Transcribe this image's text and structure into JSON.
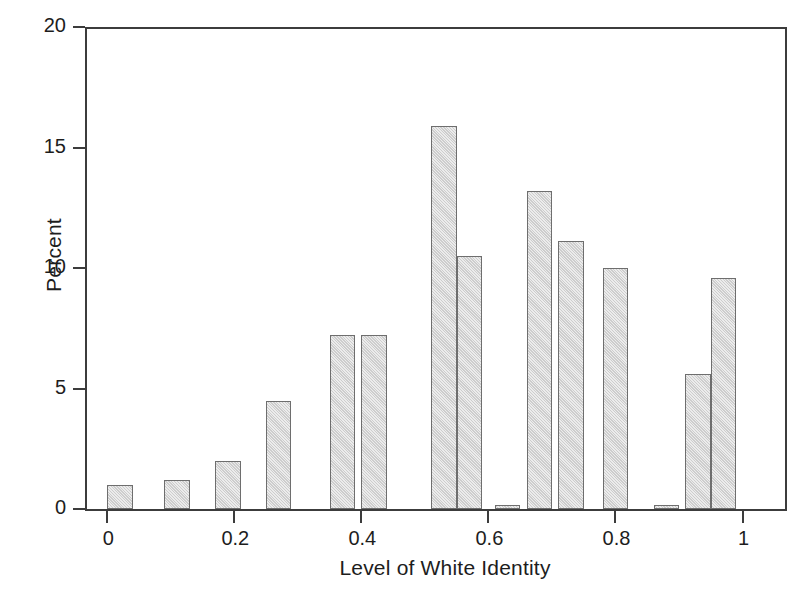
{
  "figure": {
    "background": "#ffffff",
    "bar_fill": "#d4d4d4",
    "bar_stroke": "#6e6e6e",
    "axis_color": "#3c3c3c"
  },
  "axes": {
    "ylabel": "Percent",
    "xlabel": "Level of White Identity",
    "ytick_labels": [
      "0",
      "5",
      "10",
      "15",
      "20"
    ],
    "xtick_labels": [
      "0",
      "0.2",
      "0.4",
      "0.6",
      "0.8",
      "1"
    ]
  },
  "chart_data": {
    "type": "bar",
    "title": "",
    "subtitle": "",
    "xlabel": "Level of White Identity",
    "ylabel": "Percent",
    "xlim": [
      -0.035,
      1.07
    ],
    "ylim": [
      0,
      20
    ],
    "yticks": [
      0,
      5,
      10,
      15,
      20
    ],
    "xticks": [
      0,
      0.2,
      0.4,
      0.6,
      0.8,
      1
    ],
    "grid": false,
    "legend": null,
    "bar_width": 0.04,
    "categories": [
      "0.02",
      "0.11",
      "0.19",
      "0.27",
      "0.37",
      "0.42",
      "0.53",
      "0.57",
      "0.63",
      "0.68",
      "0.73",
      "0.80",
      "0.88",
      "0.93",
      "0.97"
    ],
    "x": [
      0.02,
      0.11,
      0.19,
      0.27,
      0.37,
      0.42,
      0.53,
      0.57,
      0.63,
      0.68,
      0.73,
      0.8,
      0.88,
      0.93,
      0.97
    ],
    "values": [
      1.0,
      1.2,
      2.0,
      4.5,
      7.2,
      7.2,
      15.9,
      10.5,
      0.15,
      13.2,
      11.1,
      10.0,
      0.15,
      5.6,
      9.6
    ],
    "series": [
      {
        "name": "Percent of respondents",
        "values": [
          1.0,
          1.2,
          2.0,
          4.5,
          7.2,
          7.2,
          15.9,
          10.5,
          0.15,
          13.2,
          11.1,
          10.0,
          0.15,
          5.6,
          9.6
        ]
      }
    ]
  }
}
